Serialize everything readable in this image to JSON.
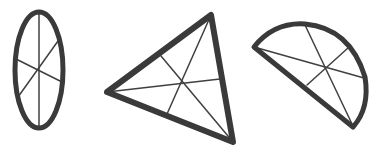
{
  "figure": {
    "colors": {
      "background": "#ffffff",
      "outline": "#3a3a3a",
      "inner_lines": "#404040"
    },
    "shapes": [
      {
        "name": "ellipse",
        "outline_width": 5,
        "inner_width": 1.5,
        "ellipse": {
          "cx": 39,
          "cy": 70,
          "rx": 24,
          "ry": 58
        },
        "lines": [
          {
            "x1": 39,
            "y1": 12,
            "x2": 39,
            "y2": 129
          },
          {
            "x1": 16,
            "y1": 59,
            "x2": 62,
            "y2": 82
          },
          {
            "x1": 58,
            "y1": 41,
            "x2": 18,
            "y2": 97
          }
        ]
      },
      {
        "name": "triangle",
        "outline_width": 6,
        "inner_width": 1.5,
        "points": "107,92 211,15 233,142",
        "lines": [
          {
            "x1": 107,
            "y1": 92,
            "x2": 220,
            "y2": 79
          },
          {
            "x1": 211,
            "y1": 15,
            "x2": 167,
            "y2": 114
          },
          {
            "x1": 233,
            "y1": 142,
            "x2": 161,
            "y2": 56
          }
        ]
      },
      {
        "name": "semicircle",
        "outline_width": 5,
        "inner_width": 1.5,
        "path": "M254,47 Q274,22 305,24 Q350,28 365,77 Q370,108 353,127 Z",
        "lines": [
          {
            "x1": 254,
            "y1": 47,
            "x2": 364,
            "y2": 78
          },
          {
            "x1": 305,
            "y1": 25,
            "x2": 352,
            "y2": 124
          },
          {
            "x1": 348,
            "y1": 48,
            "x2": 307,
            "y2": 85
          }
        ]
      }
    ]
  }
}
